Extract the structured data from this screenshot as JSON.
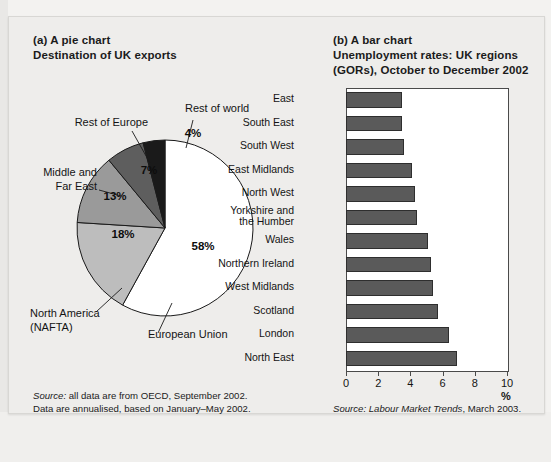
{
  "figure": {
    "panel_a": {
      "label": "(a) A pie chart",
      "title": "Destination of UK exports"
    },
    "panel_b": {
      "label": "(b) A bar chart",
      "title": "Unemployment rates: UK regions\n(GORs), October to December 2002"
    },
    "source_a": "all data are from OECD, September 2002.\nData are annualised, based on January–May 2002.",
    "source_a_prefix": "Source:",
    "source_b_prefix": "Source:",
    "source_b_italic": "Labour Market Trends",
    "source_b_rest": ", March 2003."
  },
  "chart_data": [
    {
      "type": "pie",
      "title": "Destination of UK exports",
      "labels": [
        "European Union",
        "North America\n(NAFTA)",
        "Middle and\nFar East",
        "Rest of Europe",
        "Rest of world"
      ],
      "values": [
        58,
        18,
        13,
        7,
        4
      ],
      "value_labels": [
        "58%",
        "18%",
        "13%",
        "7%",
        "4%"
      ],
      "colors": [
        "#ffffff",
        "#bdbdbd",
        "#9a9a9a",
        "#5e5e5e",
        "#1a1a1a"
      ],
      "legend": "callout-labels",
      "units": "%"
    },
    {
      "type": "bar",
      "orientation": "horizontal",
      "title": "Unemployment rates: UK regions (GORs), October to December 2002",
      "xlabel": "%",
      "ylabel": "",
      "xlim": [
        0,
        10
      ],
      "xticks": [
        0,
        2,
        4,
        6,
        8,
        10
      ],
      "xtick_labels": [
        "0",
        "2",
        "4",
        "6",
        "8",
        "10"
      ],
      "grid": false,
      "bar_color": "#5a5a5a",
      "categories": [
        "East",
        "South East",
        "South West",
        "East Midlands",
        "North West",
        "Yorkshire and\nthe Humber",
        "Wales",
        "Northern Ireland",
        "West Midlands",
        "Scotland",
        "London",
        "North East"
      ],
      "values": [
        3.5,
        3.5,
        3.6,
        4.1,
        4.3,
        4.4,
        5.1,
        5.3,
        5.4,
        5.7,
        6.4,
        6.9
      ]
    }
  ]
}
